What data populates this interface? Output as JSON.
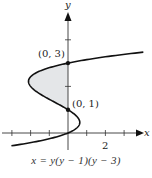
{
  "chart_data": {
    "type": "line",
    "title": "",
    "caption": "x = y(y − 1)(y − 3)",
    "equation": "x = y(y - 1)(y - 3)",
    "xlabel": "x",
    "ylabel": "y",
    "xlim": [
      -3.6,
      4.1
    ],
    "ylim": [
      -0.5,
      4.6
    ],
    "x_ticks": [
      -3,
      -2,
      -1,
      1,
      2,
      3
    ],
    "x_tick_labels": [
      {
        "value": 2,
        "label": "2"
      }
    ],
    "y_ticks": [
      2,
      4
    ],
    "points": [
      {
        "x": 0,
        "y": 3,
        "label": "(0, 3)"
      },
      {
        "x": 0,
        "y": 1,
        "label": "(0, 1)"
      }
    ],
    "shaded_region": {
      "between": "curve and y-axis",
      "y_from": 1,
      "y_to": 3,
      "color": "#e4e6e8"
    },
    "curve_y_range": [
      -0.55,
      3.47
    ],
    "grid": false,
    "legend": null
  },
  "axes": {
    "x_label": "x",
    "y_label": "y"
  },
  "points_labels": {
    "p3": "(0, 3)",
    "p1": "(0, 1)"
  },
  "tick_labels": {
    "x2": "2"
  },
  "caption": "x = y(y − 1)(y − 3)",
  "colors": {
    "curve": "#111111",
    "shade": "#e4e6e8",
    "axis": "#333333"
  }
}
